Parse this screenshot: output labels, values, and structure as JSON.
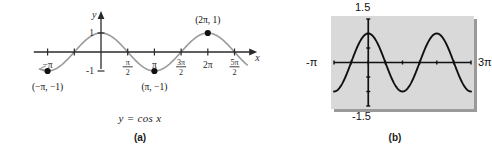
{
  "figure": {
    "type": "math-textbook-figure",
    "width": 492,
    "height": 155,
    "background": "#ffffff"
  },
  "panel_a": {
    "label": "(a)",
    "equation_caption": "y = cos x",
    "axis": {
      "x_axis_label": "x",
      "y_axis_label": "y",
      "x_tick_labels": [
        "-π",
        "π/2-neg",
        "π/2",
        "π",
        "3π/2",
        "2π",
        "5π/2"
      ],
      "y_tick_labels": [
        "1",
        "-1"
      ]
    },
    "ticks": [
      {
        "name": "neg-pi",
        "x_value": -3.14159265,
        "label_num": "",
        "label_den": "",
        "label_plain": "−π",
        "show": true
      },
      {
        "name": "neg-pi-over-2",
        "x_value": -1.57079633,
        "label_num": "π",
        "label_den": "2",
        "label_plain": "",
        "show": false
      },
      {
        "name": "pi-over-2",
        "x_value": 1.57079633,
        "label_num": "π",
        "label_den": "2",
        "label_plain": "",
        "show": true
      },
      {
        "name": "pi",
        "x_value": 3.14159265,
        "label_num": "",
        "label_den": "",
        "label_plain": "π",
        "show": true
      },
      {
        "name": "three-pi-over-2",
        "x_value": 4.71238898,
        "label_num": "3π",
        "label_den": "2",
        "label_plain": "",
        "show": true
      },
      {
        "name": "two-pi",
        "x_value": 6.28318531,
        "label_num": "",
        "label_den": "",
        "label_plain": "2π",
        "show": true
      },
      {
        "name": "five-pi-over-2",
        "x_value": 7.85398163,
        "label_num": "5π",
        "label_den": "2",
        "label_plain": "",
        "show": true
      }
    ],
    "hidden_tick_label": {
      "num": "π",
      "den": "2"
    },
    "y_ticks": [
      {
        "name": "one",
        "y_value": 1,
        "label": "1"
      },
      {
        "name": "neg-one",
        "y_value": -1,
        "label": "-1"
      }
    ],
    "points": [
      {
        "name": "point-neg-pi",
        "label": "(−π, −1)",
        "x": -3.14159265,
        "y": -1
      },
      {
        "name": "point-pi",
        "label": "(π, −1)",
        "x": 3.14159265,
        "y": -1
      },
      {
        "name": "point-two-pi",
        "label": "(2π, 1)",
        "x": 6.28318531,
        "y": 1
      }
    ],
    "curve": {
      "function": "cos",
      "x_min": -3.6,
      "x_max": 8.6,
      "y_min": -1,
      "y_max": 1,
      "color": "#9b9b9b"
    },
    "axis_color": "#2a2a2a"
  },
  "panel_b": {
    "label": "(b)",
    "screen": {
      "top_value": "1.5",
      "bottom_value": "-1.5",
      "left_value": "-π",
      "right_value": "3π",
      "x_min": -3.14159265,
      "x_max": 9.42477796,
      "y_min": -1.5,
      "y_max": 1.5,
      "x_scale_label": "π/2",
      "y_scale_label": "0.5",
      "background": "#d9d9d9",
      "border_color": "#4a4a4a",
      "curve_color": "#111111"
    },
    "curve": {
      "function": "cos",
      "color": "#111111"
    }
  },
  "chart_data": [
    {
      "type": "line",
      "id": "panel-a-cosine",
      "title": "y = cos x",
      "subtitle": "(a)",
      "xlabel": "x",
      "ylabel": "y",
      "xlim": [
        -3.6,
        8.6
      ],
      "ylim": [
        -1.4,
        1.4
      ],
      "grid": false,
      "legend": null,
      "xticks": [
        -3.14159265,
        -1.57079633,
        1.57079633,
        3.14159265,
        4.71238898,
        6.28318531,
        7.85398163
      ],
      "xticklabels": [
        "-π",
        "π/2",
        "π/2",
        "π",
        "3π/2",
        "2π",
        "5π/2"
      ],
      "yticks": [
        -1,
        1
      ],
      "yticklabels": [
        "-1",
        "1"
      ],
      "series": [
        {
          "name": "y = cos x",
          "color": "#9b9b9b",
          "x": [
            -3.6,
            -3.14159265,
            -2.5,
            -2.0,
            -1.57079633,
            -1.0,
            -0.5,
            0,
            0.5,
            1.0,
            1.57079633,
            2.0,
            2.5,
            3.14159265,
            3.6,
            4.0,
            4.71238898,
            5.2,
            5.8,
            6.28318531,
            6.8,
            7.4,
            7.85398163,
            8.2,
            8.6
          ],
          "y": [
            -0.8968,
            -1,
            -0.8011,
            -0.4161,
            0,
            0.5403,
            0.8776,
            1,
            0.8776,
            0.5403,
            0,
            -0.4161,
            -0.8011,
            -1,
            -0.8968,
            -0.6536,
            0,
            0.4685,
            0.8855,
            1,
            0.8694,
            0.5487,
            0,
            -0.3073,
            -0.6935
          ]
        }
      ],
      "annotations": [
        {
          "name": "point-neg-pi",
          "text": "(−π, −1)",
          "x": -3.14159265,
          "y": -1
        },
        {
          "name": "point-pi",
          "text": "(π, −1)",
          "x": 3.14159265,
          "y": -1
        },
        {
          "name": "point-two-pi",
          "text": "(2π, 1)",
          "x": 6.28318531,
          "y": 1
        }
      ]
    },
    {
      "type": "line",
      "id": "panel-b-calculator-screen",
      "title": "",
      "subtitle": "(b)",
      "xlabel": "",
      "ylabel": "",
      "xlim": [
        -3.14159265,
        9.42477796
      ],
      "ylim": [
        -1.5,
        1.5
      ],
      "grid": false,
      "legend": null,
      "xticks": [
        -1.57079633,
        0,
        1.57079633,
        3.14159265,
        4.71238898,
        6.28318531,
        7.85398163,
        9.42477796
      ],
      "xticklabels": [
        "",
        "",
        "",
        "",
        "",
        "",
        "",
        ""
      ],
      "yticks": [
        -1.5,
        -1.0,
        -0.5,
        0,
        0.5,
        1.0,
        1.5
      ],
      "yticklabels": [
        "-1.5",
        "",
        "",
        "",
        "",
        "",
        "1.5"
      ],
      "series": [
        {
          "name": "y = cos x",
          "color": "#111111",
          "x": [
            -3.14159265,
            -2.6,
            -2.0,
            -1.57079633,
            -1.0,
            -0.5,
            0,
            0.5,
            1.0,
            1.57079633,
            2.0,
            2.6,
            3.14159265,
            3.7,
            4.2,
            4.71238898,
            5.3,
            5.8,
            6.28318531,
            6.8,
            7.4,
            7.85398163,
            8.4,
            9.0,
            9.42477796
          ],
          "y": [
            -1,
            -0.8569,
            -0.4161,
            0,
            0.5403,
            0.8776,
            1,
            0.8776,
            0.5403,
            0,
            -0.4161,
            -0.8569,
            -1,
            -0.8486,
            -0.4903,
            0,
            0.5544,
            0.8855,
            1,
            0.8694,
            0.5487,
            0,
            -0.5298,
            -0.9111,
            -1
          ]
        }
      ],
      "annotations": [
        {
          "name": "screen-top-value",
          "text": "1.5"
        },
        {
          "name": "screen-bottom-value",
          "text": "-1.5"
        },
        {
          "name": "screen-left-value",
          "text": "-π"
        },
        {
          "name": "screen-right-value",
          "text": "3π"
        }
      ]
    }
  ]
}
